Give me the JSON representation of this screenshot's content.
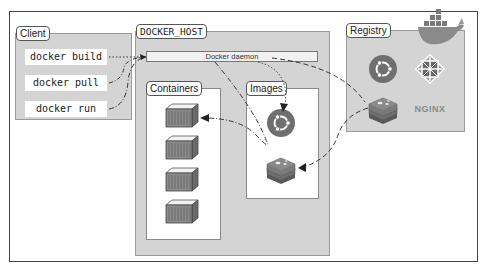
{
  "diagram": {
    "client": {
      "label": "Client",
      "commands": [
        "docker build",
        "docker pull",
        "docker run"
      ]
    },
    "docker_host": {
      "label": "DOCKER_HOST",
      "daemon_label": "Docker daemon",
      "containers": {
        "label": "Containers",
        "count": 4
      },
      "images": {
        "label": "Images",
        "items": [
          "ubuntu-icon",
          "redis-icon"
        ]
      }
    },
    "registry": {
      "label": "Registry",
      "items": [
        "ubuntu-icon",
        "centos-icon",
        "redis-icon",
        "nginx-logo"
      ],
      "nginx_text": "NGINX"
    },
    "colors": {
      "panel": "#d4d4d4",
      "ubuntu": "#7a7a7a",
      "redis": "#6f6f6f",
      "frame": "#444444"
    }
  }
}
